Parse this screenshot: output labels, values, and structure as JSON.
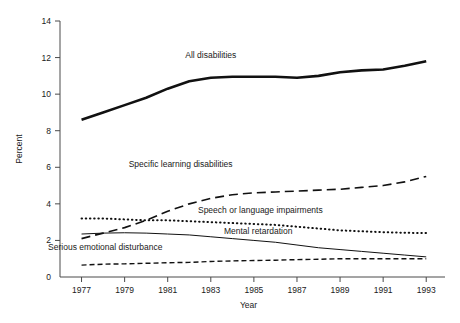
{
  "chart_data": {
    "type": "line",
    "title": "",
    "xlabel": "Year",
    "ylabel": "Percent",
    "xlim": [
      1976,
      1993.5
    ],
    "ylim": [
      0,
      14
    ],
    "grid": false,
    "legend": "inline-annotations",
    "x": [
      1977,
      1978,
      1979,
      1980,
      1981,
      1982,
      1983,
      1984,
      1985,
      1986,
      1987,
      1988,
      1989,
      1990,
      1991,
      1992,
      1993
    ],
    "xticks": [
      1977,
      1979,
      1981,
      1983,
      1985,
      1987,
      1989,
      1991,
      1993
    ],
    "xtick_labels": [
      "1977",
      "1979",
      "1981",
      "1983",
      "1985",
      "1987",
      "1989",
      "1991",
      "1993"
    ],
    "yticks": [
      0,
      2,
      4,
      6,
      8,
      10,
      12,
      14
    ],
    "ytick_labels": [
      "0",
      "2",
      "4",
      "6",
      "8",
      "10",
      "12",
      "14"
    ],
    "series": [
      {
        "name": "All disabilities",
        "style": "solid-thick",
        "label_x": 1983.0,
        "label_y": 12.0,
        "values": [
          8.6,
          9.0,
          9.4,
          9.8,
          10.3,
          10.7,
          10.9,
          10.95,
          10.95,
          10.95,
          10.9,
          11.0,
          11.2,
          11.3,
          11.35,
          11.55,
          11.8
        ]
      },
      {
        "name": "Specific learning disabilities",
        "style": "dashed-long",
        "label_x": 1981.6,
        "label_y": 6.0,
        "values": [
          2.1,
          2.4,
          2.7,
          3.1,
          3.6,
          4.0,
          4.3,
          4.5,
          4.6,
          4.65,
          4.7,
          4.75,
          4.8,
          4.9,
          5.0,
          5.2,
          5.5
        ]
      },
      {
        "name": "Speech or language impairments",
        "style": "dotted",
        "label_x": 1985.3,
        "label_y": 3.5,
        "values": [
          3.2,
          3.2,
          3.15,
          3.1,
          3.1,
          3.05,
          3.0,
          2.95,
          2.9,
          2.85,
          2.75,
          2.65,
          2.55,
          2.5,
          2.45,
          2.42,
          2.4
        ]
      },
      {
        "name": "Mental retardation",
        "style": "solid-thin",
        "label_x": 1985.2,
        "label_y": 2.35,
        "values": [
          2.35,
          2.4,
          2.42,
          2.4,
          2.35,
          2.3,
          2.2,
          2.1,
          2.0,
          1.9,
          1.75,
          1.6,
          1.5,
          1.4,
          1.3,
          1.2,
          1.1
        ]
      },
      {
        "name": "Serious emotional disturbance",
        "style": "dashed-short",
        "label_x": 1978.1,
        "label_y": 1.45,
        "values": [
          0.65,
          0.7,
          0.72,
          0.75,
          0.78,
          0.8,
          0.85,
          0.88,
          0.9,
          0.92,
          0.95,
          0.97,
          1.0,
          1.0,
          1.0,
          1.0,
          1.0
        ]
      }
    ]
  }
}
